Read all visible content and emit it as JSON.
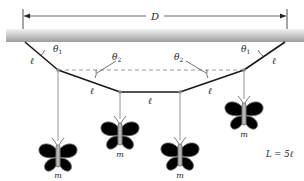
{
  "diagram": {
    "type": "physics-mobile",
    "dimension_label": "D",
    "angle_labels": {
      "theta1_left": "θ",
      "theta1_right": "θ",
      "theta2_left": "θ",
      "theta2_right": "θ",
      "sub1": "1",
      "sub2": "2"
    },
    "segment_label": "ℓ",
    "mass_label": "m",
    "relation": "L = 5ℓ",
    "colors": {
      "ceiling_light": "#e8e8e8",
      "ceiling_dark": "#a8a8a8",
      "string": "#1a1a1a",
      "dashed": "#9a9a9a",
      "hanger": "#8a8a8a",
      "wing_fill_light": "#e0e0e0",
      "wing_fill_dark": "#a6a6a6",
      "wing_inner": "#c8c8c8"
    }
  }
}
